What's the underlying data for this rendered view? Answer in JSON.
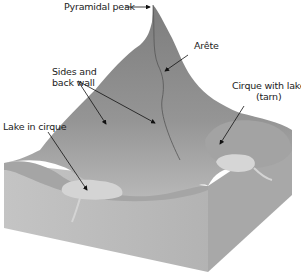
{
  "diagram": {
    "type": "glacial landform block diagram",
    "labels": {
      "pyramidal_peak": "Pyramidal peak",
      "arete": "Arête",
      "sides_back_wall_line1": "Sides and",
      "sides_back_wall_line2": "back wall",
      "cirque_lake_line1": "Cirque with lake",
      "cirque_lake_line2": "(tarn)",
      "lake_in_cirque": "Lake in cirque"
    },
    "colors": {
      "mountain": "#8a8a8a",
      "mountain_light": "#b5b5b5",
      "front_face": "#bdbdbd",
      "side_face": "#a9a9a9",
      "lake": "#d4d4d4",
      "arrow": "#111111"
    }
  }
}
